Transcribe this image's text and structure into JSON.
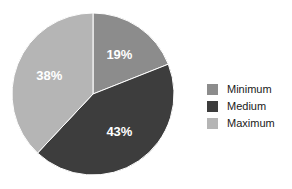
{
  "chart_data": {
    "type": "pie",
    "title": "",
    "categories": [
      "Minimum",
      "Medium",
      "Maximum"
    ],
    "values": [
      19,
      43,
      38
    ],
    "value_labels": [
      "19%",
      "43%",
      "38%"
    ],
    "colors": [
      "#8c8c8c",
      "#3d3d3d",
      "#b5b5b5"
    ],
    "start_angle_deg": 0,
    "direction": "clockwise",
    "legend_position": "right",
    "grid": false,
    "background": "#ffffff",
    "label_color": "#ffffff"
  },
  "slices": [
    {
      "label": "19%",
      "name": "Minimum",
      "value": 19,
      "color": "#8c8c8c"
    },
    {
      "label": "43%",
      "name": "Medium",
      "value": 43,
      "color": "#3d3d3d"
    },
    {
      "label": "38%",
      "name": "Maximum",
      "value": 38,
      "color": "#b5b5b5"
    }
  ],
  "legend": {
    "items": [
      {
        "label": "Minimum",
        "color": "#8c8c8c"
      },
      {
        "label": "Medium",
        "color": "#3d3d3d"
      },
      {
        "label": "Maximum",
        "color": "#b5b5b5"
      }
    ]
  }
}
